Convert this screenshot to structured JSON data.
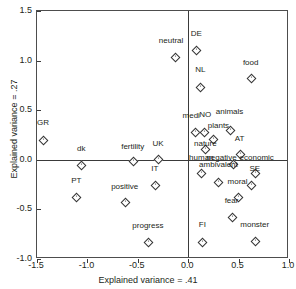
{
  "chart_data": {
    "type": "scatter",
    "title": "",
    "xlabel": "Explained variance = .41",
    "ylabel": "Explained variance = .27",
    "xlim": [
      -1.5,
      1.0
    ],
    "ylim": [
      -1.0,
      1.5
    ],
    "xticks": [
      "-1.5",
      "-1.0",
      "-0.5",
      "0.0",
      "0.5",
      "1.0"
    ],
    "xtickvals": [
      -1.5,
      -1.0,
      -0.5,
      0.0,
      0.5,
      1.0
    ],
    "yticks": [
      "1.5",
      "1.0",
      "0.5",
      "0.0",
      "-0.5",
      "-1.0"
    ],
    "ytickvals": [
      1.5,
      1.0,
      0.5,
      0.0,
      -0.5,
      -1.0
    ],
    "grid": false,
    "legend": "none",
    "origin_lines": true,
    "marker": "open-diamond",
    "points": [
      {
        "label": "GR",
        "x": -1.44,
        "y": 0.2,
        "lx": -1.44,
        "ly": 0.33
      },
      {
        "label": "dk",
        "x": -1.06,
        "y": -0.05,
        "lx": -1.06,
        "ly": 0.07
      },
      {
        "label": "PT",
        "x": -1.11,
        "y": -0.37,
        "lx": -1.11,
        "ly": -0.25
      },
      {
        "label": "fertility",
        "x": -0.55,
        "y": -0.01,
        "lx": -0.55,
        "ly": 0.09
      },
      {
        "label": "UK",
        "x": -0.3,
        "y": 0.01,
        "lx": -0.3,
        "ly": 0.12
      },
      {
        "label": "IT",
        "x": -0.33,
        "y": -0.25,
        "lx": -0.33,
        "ly": -0.13
      },
      {
        "label": "positive",
        "x": -0.63,
        "y": -0.43,
        "lx": -0.63,
        "ly": -0.31
      },
      {
        "label": "progress",
        "x": -0.4,
        "y": -0.83,
        "lx": -0.4,
        "ly": -0.71
      },
      {
        "label": "neutral",
        "x": -0.13,
        "y": 1.04,
        "lx": -0.17,
        "ly": 1.16
      },
      {
        "label": "DE",
        "x": 0.08,
        "y": 1.11,
        "lx": 0.08,
        "ly": 1.23
      },
      {
        "label": "NL",
        "x": 0.12,
        "y": 0.73,
        "lx": 0.12,
        "ly": 0.86
      },
      {
        "label": "food",
        "x": 0.62,
        "y": 0.82,
        "lx": 0.62,
        "ly": 0.94
      },
      {
        "label": "medi",
        "x": 0.07,
        "y": 0.28,
        "lx": 0.03,
        "ly": 0.4
      },
      {
        "label": "NO",
        "x": 0.16,
        "y": 0.28,
        "lx": 0.17,
        "ly": 0.41
      },
      {
        "label": "plants",
        "x": 0.25,
        "y": 0.21,
        "lx": 0.3,
        "ly": 0.3
      },
      {
        "label": "animals",
        "x": 0.41,
        "y": 0.3,
        "lx": 0.41,
        "ly": 0.44
      },
      {
        "label": "AT",
        "x": 0.51,
        "y": 0.06,
        "lx": 0.51,
        "ly": 0.17
      },
      {
        "label": "nature",
        "x": 0.17,
        "y": 0.11,
        "lx": 0.17,
        "ly": 0.12
      },
      {
        "label": "human",
        "x": 0.13,
        "y": -0.13,
        "lx": 0.13,
        "ly": -0.02
      },
      {
        "label": "negative",
        "x": 0.44,
        "y": -0.04,
        "lx": 0.33,
        "ly": -0.02
      },
      {
        "label": "economic",
        "x": 0.66,
        "y": -0.13,
        "lx": 0.68,
        "ly": -0.02
      },
      {
        "label": "ambivalent",
        "x": 0.3,
        "y": -0.22,
        "lx": 0.3,
        "ly": -0.09
      },
      {
        "label": "SE",
        "x": 0.62,
        "y": -0.25,
        "lx": 0.66,
        "ly": -0.13
      },
      {
        "label": "moral",
        "x": 0.49,
        "y": -0.38,
        "lx": 0.49,
        "ly": -0.26
      },
      {
        "label": "fear",
        "x": 0.43,
        "y": -0.58,
        "lx": 0.43,
        "ly": -0.46
      },
      {
        "label": "FI",
        "x": 0.14,
        "y": -0.83,
        "lx": 0.14,
        "ly": -0.7
      },
      {
        "label": "monster",
        "x": 0.66,
        "y": -0.82,
        "lx": 0.66,
        "ly": -0.7
      }
    ]
  },
  "style": {
    "axis_color": "#3a3a3a",
    "frame_color": "#4d4d4d",
    "marker_edge": "#333333",
    "marker_fill": "#ffffff",
    "text_color": "#231f20",
    "background": "#ffffff"
  }
}
